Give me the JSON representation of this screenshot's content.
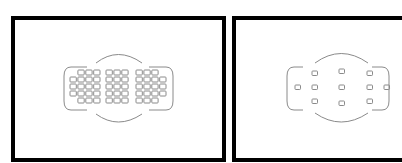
{
  "diagram": {
    "type": "af-point-layout-comparison",
    "panels": [
      {
        "id": "left",
        "description": "Dense AF point grid",
        "groups": [
          {
            "name": "left-group",
            "rows": [
              3,
              4,
              4,
              4,
              3
            ]
          },
          {
            "name": "center-group",
            "rows": [
              3,
              3,
              3,
              3,
              3
            ]
          },
          {
            "name": "right-group",
            "rows": [
              3,
              4,
              4,
              4,
              3
            ]
          }
        ],
        "total_points": 51
      },
      {
        "id": "right",
        "description": "Sparse AF point layout",
        "total_points": 11
      }
    ],
    "colors": {
      "frame": "#000000",
      "outline": "#8a8a8a",
      "background": "#ffffff"
    }
  }
}
